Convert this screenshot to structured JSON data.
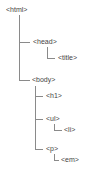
{
  "tree": {
    "html": "<html>",
    "head": "<head>",
    "title": "<title>",
    "body": "<body>",
    "h1": "<h1>",
    "ul": "<ul>",
    "li": "<li>",
    "p": "<p>",
    "em": "<em>"
  },
  "colors": {
    "text": "#444444",
    "line": "#8a8a8a",
    "background": "#ffffff"
  }
}
